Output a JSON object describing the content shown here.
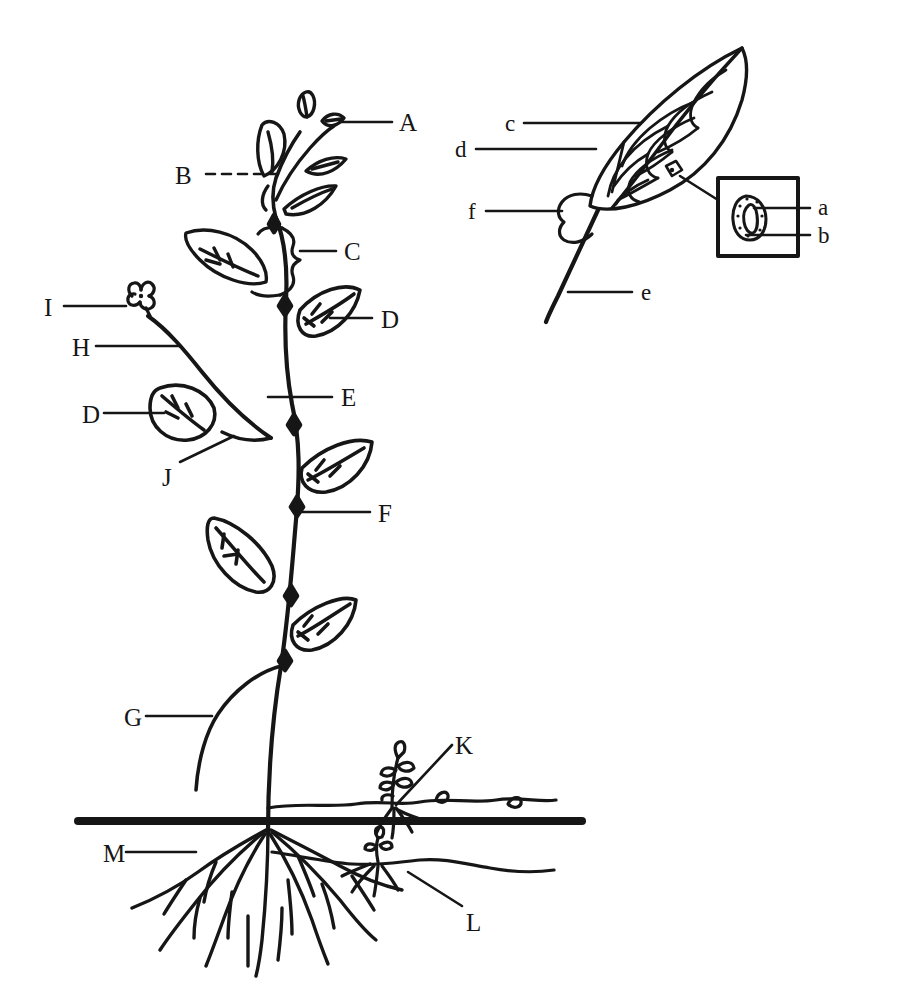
{
  "figure": {
    "background_color": "#ffffff",
    "ink_color": "#161616",
    "width": 900,
    "height": 1007
  },
  "main_plant": {
    "name": "whole-plant-diagram",
    "labels": [
      {
        "id": "A",
        "text": "A",
        "x": 399,
        "y": 110,
        "leader": "solid",
        "target": "shoot-tip-terminal-bud"
      },
      {
        "id": "B",
        "text": "B",
        "x": 175,
        "y": 163,
        "leader": "dashed",
        "target": "young-leaf-node"
      },
      {
        "id": "C",
        "text": "C",
        "x": 344,
        "y": 239,
        "leader": "solid",
        "target": "internode-brace"
      },
      {
        "id": "D1",
        "text": "D",
        "x": 381,
        "y": 307,
        "leader": "solid",
        "target": "leaf-blade-upper"
      },
      {
        "id": "E",
        "text": "E",
        "x": 341,
        "y": 385,
        "leader": "solid",
        "target": "stem-main-axis"
      },
      {
        "id": "I",
        "text": "I",
        "x": 44,
        "y": 295,
        "leader": "solid",
        "target": "flower"
      },
      {
        "id": "H",
        "text": "H",
        "x": 72,
        "y": 335,
        "leader": "solid",
        "target": "lateral-branch"
      },
      {
        "id": "D2",
        "text": "D",
        "x": 82,
        "y": 402,
        "leader": "solid",
        "target": "leaf-blade-branch"
      },
      {
        "id": "J",
        "text": "J",
        "x": 162,
        "y": 465,
        "leader": "solid",
        "target": "branch-axil"
      },
      {
        "id": "F",
        "text": "F",
        "x": 378,
        "y": 501,
        "leader": "solid",
        "target": "node"
      },
      {
        "id": "G",
        "text": "G",
        "x": 124,
        "y": 705,
        "leader": "solid",
        "target": "lower-branch-petiole"
      },
      {
        "id": "K",
        "text": "K",
        "x": 455,
        "y": 733,
        "leader": "solid",
        "target": "stolon-runner"
      },
      {
        "id": "M",
        "text": "M",
        "x": 103,
        "y": 841,
        "leader": "solid",
        "target": "root-system"
      },
      {
        "id": "L",
        "text": "L",
        "x": 466,
        "y": 910,
        "leader": "solid",
        "target": "rhizome"
      }
    ]
  },
  "leaf_detail": {
    "name": "leaf-detail-diagram",
    "labels": [
      {
        "id": "c",
        "text": "c",
        "x": 505,
        "y": 112,
        "leader": "solid",
        "target": "leaf-vein-secondary"
      },
      {
        "id": "d",
        "text": "d",
        "x": 455,
        "y": 138,
        "leader": "solid",
        "target": "leaf-margin-blade"
      },
      {
        "id": "f",
        "text": "f",
        "x": 468,
        "y": 200,
        "leader": "solid",
        "target": "stipule"
      },
      {
        "id": "e",
        "text": "e",
        "x": 641,
        "y": 281,
        "leader": "solid",
        "target": "petiole"
      }
    ]
  },
  "stomata_inset": {
    "name": "stomata-inset-box",
    "box": {
      "x": 718,
      "y": 178,
      "width": 80,
      "height": 78
    },
    "labels": [
      {
        "id": "a",
        "text": "a",
        "x": 818,
        "y": 196,
        "leader": "solid",
        "target": "stoma-pore"
      },
      {
        "id": "b",
        "text": "b",
        "x": 818,
        "y": 224,
        "leader": "solid",
        "target": "guard-cell"
      }
    ]
  }
}
